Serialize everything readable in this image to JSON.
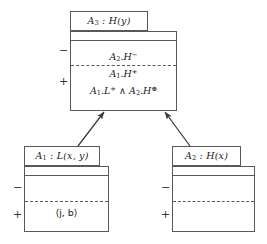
{
  "diagram": {
    "type": "agent-interaction-diagram",
    "line_color": "#595959",
    "text_color": "#1a1a1a",
    "background": "#ffffff",
    "negative_sign": "−",
    "positive_sign": "+"
  },
  "boxes": {
    "top": {
      "name": "A3",
      "title_prefix": "A",
      "title_index": "3",
      "title_suffix": " : H(y)",
      "negative_lines": [
        "A2.H−"
      ],
      "positive_lines": [
        "A1.H+",
        "A1.L+ ∧ A2.H⊕"
      ],
      "neg_marker": "−",
      "pos_marker": "+"
    },
    "left": {
      "name": "A1",
      "title_prefix": "A",
      "title_index": "1",
      "title_suffix": " : L(x, y)",
      "negative_lines": [],
      "positive_lines": [
        "⟨j, b⟩"
      ],
      "neg_marker": "−",
      "pos_marker": "+"
    },
    "right": {
      "name": "A2",
      "title_prefix": "A",
      "title_index": "2",
      "title_suffix": " : H(x)",
      "negative_lines": [],
      "positive_lines": [],
      "neg_marker": "−",
      "pos_marker": "+"
    }
  },
  "arrows": [
    {
      "from": "left",
      "to": "top",
      "style": "solid",
      "head": "filled"
    },
    {
      "from": "right",
      "to": "top",
      "style": "solid",
      "head": "filled"
    }
  ]
}
